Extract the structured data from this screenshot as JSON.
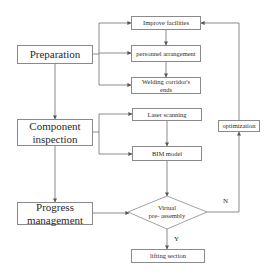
{
  "diagram": {
    "left_column": [
      {
        "id": "preparation",
        "label": "Preparation"
      },
      {
        "id": "component_inspection",
        "label": "Component inspection"
      },
      {
        "id": "progress_management",
        "label": "Progress management"
      }
    ],
    "preparation_steps": [
      {
        "id": "improve_facilities",
        "label": "Improve facilities"
      },
      {
        "id": "personnel_arrangement",
        "label": "personnel arrangement"
      },
      {
        "id": "welding_corridor",
        "label": "Welding  corridor's ends"
      }
    ],
    "inspection_steps": [
      {
        "id": "laser_scanning",
        "label": "Laser scanning"
      },
      {
        "id": "bim_model",
        "label": "BIM model"
      }
    ],
    "decision": {
      "id": "virtual_preassembly",
      "label_line1": "Virtual",
      "label_line2": "pre- assembly"
    },
    "yes_label": "Y",
    "no_label": "N",
    "yes_target": {
      "id": "lifting_section",
      "label": "lifting section"
    },
    "no_target": {
      "id": "optimization",
      "label": "optimization"
    },
    "colors": {
      "line": "#6e6e6e",
      "border": "#8a8a8a",
      "text": "#2a2a2a"
    }
  }
}
